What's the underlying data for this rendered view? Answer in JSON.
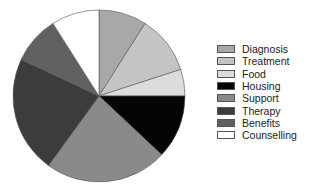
{
  "chart_data": {
    "type": "pie",
    "title": "",
    "start": "top",
    "direction": "clockwise",
    "legend_position": "right",
    "slices": [
      {
        "label": "Diagnosis",
        "value": 9,
        "color": "#a8a8a8"
      },
      {
        "label": "Treatment",
        "value": 11,
        "color": "#c4c4c4"
      },
      {
        "label": "Food",
        "value": 5,
        "color": "#dcdcdc"
      },
      {
        "label": "Housing",
        "value": 12,
        "color": "#050505"
      },
      {
        "label": "Support",
        "value": 23,
        "color": "#8a8a8a"
      },
      {
        "label": "Therapy",
        "value": 22,
        "color": "#3c3c3c"
      },
      {
        "label": "Benefits",
        "value": 9,
        "color": "#616161"
      },
      {
        "label": "Counselling",
        "value": 9,
        "color": "#ffffff"
      }
    ]
  }
}
